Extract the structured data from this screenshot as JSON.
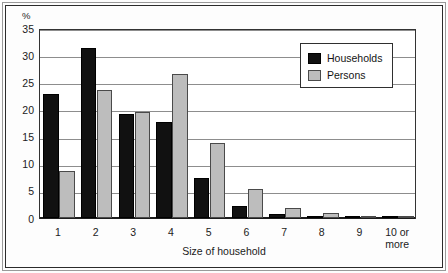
{
  "figure": {
    "unit_label": "%",
    "legend": {
      "households_label": "Households",
      "persons_label": "Persons"
    }
  },
  "chart_data": {
    "type": "bar",
    "title": "",
    "subtitle": "",
    "xlabel": "Size of household",
    "ylabel": "%",
    "ylim": [
      0,
      35
    ],
    "yticks": [
      0,
      5,
      10,
      15,
      20,
      25,
      30,
      35
    ],
    "ytick_labels": [
      "0",
      "5",
      "10",
      "15",
      "20",
      "25",
      "30",
      "35"
    ],
    "grid": true,
    "grid_axis": "y",
    "legend_position": "top-right",
    "categories": [
      "1",
      "2",
      "3",
      "4",
      "5",
      "6",
      "7",
      "8",
      "9",
      "10 or more"
    ],
    "category_labels": [
      "1",
      "2",
      "3",
      "4",
      "5",
      "6",
      "7",
      "8",
      "9",
      "10 or\nmore"
    ],
    "series": [
      {
        "name": "Households",
        "color": "#111111",
        "values": [
          22.8,
          31.3,
          19.2,
          17.7,
          7.4,
          2.2,
          0.7,
          0.3,
          0.2,
          0.2
        ]
      },
      {
        "name": "Persons",
        "color": "#bdbdbd",
        "values": [
          8.7,
          23.5,
          19.6,
          26.5,
          13.9,
          5.3,
          1.9,
          0.9,
          0.4,
          0.4
        ]
      }
    ]
  }
}
